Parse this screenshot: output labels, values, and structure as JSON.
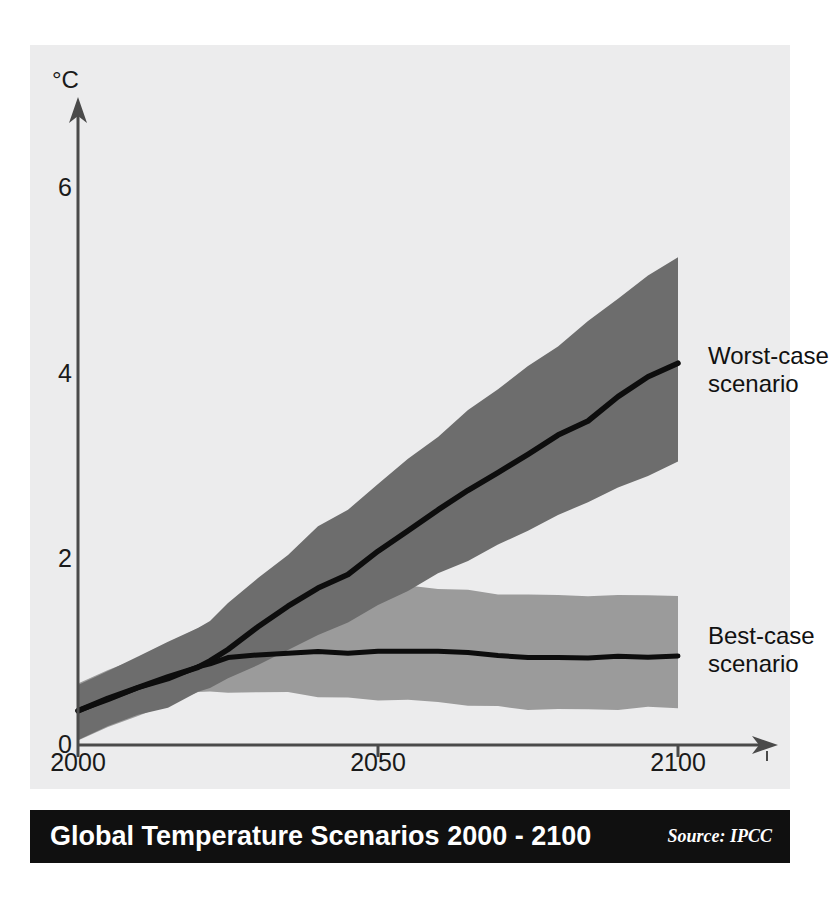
{
  "figure": {
    "background": "#ffffff",
    "panel_background": "#ececed"
  },
  "axes": {
    "unit_label": "°C",
    "y_ticks": [
      "0",
      "2",
      "4",
      "6"
    ],
    "x_ticks": [
      "2000",
      "2050",
      "2100"
    ]
  },
  "annotations": {
    "worst_case": "Worst-case\nscenario",
    "best_case": "Best-case\nscenario"
  },
  "titlebar": {
    "title": "Global Temperature Scenarios 2000 - 2100",
    "source": "Source: IPCC",
    "background": "#101010",
    "text_color": "#ffffff"
  },
  "chart_data": {
    "type": "area",
    "title": "Global Temperature Scenarios 2000 - 2100",
    "subtitle": "",
    "xlabel": "",
    "ylabel": "°C",
    "xlim": [
      2000,
      2100
    ],
    "ylim": [
      0,
      6.8
    ],
    "xticks": [
      2000,
      2050,
      2100
    ],
    "yticks": [
      0,
      2,
      4,
      6
    ],
    "grid": false,
    "legend": "inline-annotations-right",
    "colors": {
      "worst_band": "#6d6d6d",
      "best_band": "#9b9b9b",
      "line": "#0d0d0d",
      "axis": "#4a4a4a"
    },
    "x": [
      2000,
      2005,
      2010,
      2015,
      2020,
      2022,
      2025,
      2030,
      2035,
      2040,
      2045,
      2050,
      2055,
      2060,
      2065,
      2070,
      2075,
      2080,
      2085,
      2090,
      2095,
      2100
    ],
    "series": [
      {
        "name": "Worst-case scenario",
        "type": "line",
        "values": [
          0.36,
          0.5,
          0.62,
          0.72,
          0.84,
          0.9,
          1.03,
          1.27,
          1.49,
          1.7,
          1.83,
          2.1,
          2.32,
          2.55,
          2.74,
          2.93,
          3.12,
          3.33,
          3.5,
          3.74,
          3.95,
          4.12
        ]
      },
      {
        "name": "Worst-case uncertainty band upper",
        "type": "band-upper",
        "values": [
          0.66,
          0.8,
          0.95,
          1.1,
          1.28,
          1.35,
          1.53,
          1.8,
          2.05,
          2.33,
          2.54,
          2.82,
          3.08,
          3.34,
          3.6,
          3.83,
          4.07,
          4.32,
          4.58,
          4.83,
          5.08,
          5.23
        ]
      },
      {
        "name": "Worst-case uncertainty band lower",
        "type": "band-lower",
        "values": [
          0.07,
          0.18,
          0.3,
          0.42,
          0.55,
          0.6,
          0.7,
          0.87,
          1.02,
          1.2,
          1.34,
          1.52,
          1.68,
          1.85,
          2.0,
          2.15,
          2.33,
          2.49,
          2.64,
          2.78,
          2.92,
          3.04
        ]
      },
      {
        "name": "Best-case scenario",
        "type": "line",
        "values": [
          0.36,
          0.5,
          0.62,
          0.72,
          0.84,
          0.88,
          0.93,
          0.98,
          1.0,
          1.0,
          1.0,
          1.0,
          1.01,
          1.02,
          1.0,
          0.97,
          0.95,
          0.95,
          0.95,
          0.95,
          0.95,
          0.95
        ]
      },
      {
        "name": "Best-case uncertainty band upper",
        "type": "band-upper",
        "values": [
          0.66,
          0.8,
          0.95,
          1.1,
          1.28,
          1.33,
          1.38,
          1.45,
          1.5,
          1.56,
          1.62,
          1.66,
          1.7,
          1.66,
          1.66,
          1.62,
          1.62,
          1.6,
          1.58,
          1.6,
          1.62,
          1.62
        ]
      },
      {
        "name": "Best-case uncertainty band lower",
        "type": "band-lower",
        "values": [
          0.07,
          0.18,
          0.3,
          0.42,
          0.55,
          0.58,
          0.58,
          0.57,
          0.55,
          0.52,
          0.5,
          0.48,
          0.47,
          0.45,
          0.43,
          0.42,
          0.4,
          0.4,
          0.4,
          0.4,
          0.4,
          0.4
        ]
      }
    ],
    "annotations": [
      {
        "text": "Worst-case scenario",
        "x": 2103,
        "y": 3.9
      },
      {
        "text": "Best-case scenario",
        "x": 2103,
        "y": 1.05
      }
    ]
  }
}
